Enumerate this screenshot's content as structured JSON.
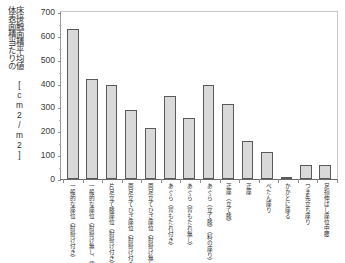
{
  "axis": {
    "y_title_line1": "体表面積当たりの",
    "y_title_line2": "床接触面積平均値 [cm2/m2]",
    "y_title_line2_main": "床接触面積平均値",
    "y_title_unit": "[cm²/m²]",
    "y_ticks": [
      "0",
      "100",
      "200",
      "300",
      "400",
      "500",
      "600",
      "700"
    ]
  },
  "chart_data": {
    "type": "bar",
    "title": "",
    "xlabel": "",
    "ylabel": "体表面積当たりの床接触面積平均値 [cm²/m²]",
    "ylim": [
      0,
      700
    ],
    "ytick_step": 100,
    "grid": false,
    "legend": "none",
    "bar_color": "#d9d9d9",
    "bar_edge_color": "#5a5a5a",
    "categories": [
      "一般的な座位（肘掛け付き）",
      "一般的な座位（肘掛け無し、背もたれ付き）",
      "片足立て膝座位（肘掛け付き）",
      "両足立てひざ座位（肘掛け付き）",
      "両足立てひざ座位（肘掛け無し）",
      "あぐら（背もたれ付き）",
      "あぐら（背もたれ無し）",
      "あぐら（立て膝）（料の座り）",
      "正座（立て膝）",
      "正座",
      "ぺたん座り",
      "かかとに座る",
      "つま先立ち座り",
      "足指伸ばし座位中腰"
    ],
    "values": [
      630,
      420,
      395,
      290,
      215,
      350,
      255,
      395,
      315,
      160,
      115,
      10,
      60,
      60
    ]
  }
}
